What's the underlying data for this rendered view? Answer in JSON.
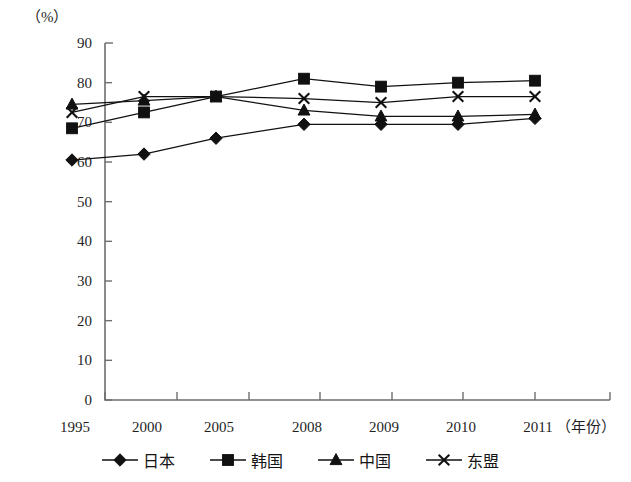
{
  "chart_data": {
    "type": "line",
    "title": "",
    "subtitle": "",
    "xlabel": "（年份）",
    "ylabel": "（%）",
    "x": [
      "1995",
      "2000",
      "2005",
      "2008",
      "2009",
      "2010",
      "2011"
    ],
    "categories": [
      "1995",
      "2000",
      "2005",
      "2008",
      "2009",
      "2010",
      "2011"
    ],
    "ylim": [
      0,
      90
    ],
    "yticks": [
      0,
      10,
      20,
      30,
      40,
      50,
      60,
      70,
      80,
      90
    ],
    "ytick_labels": [
      "0",
      "10",
      "20",
      "30",
      "40",
      "50",
      "60",
      "70",
      "80",
      "90"
    ],
    "grid": false,
    "legend_position": "bottom",
    "series": [
      {
        "name": "日本",
        "marker": "diamond",
        "color": "#111111",
        "values": [
          60.5,
          62.0,
          66.0,
          69.5,
          69.5,
          69.5,
          71.0
        ]
      },
      {
        "name": "韩国",
        "marker": "square",
        "color": "#111111",
        "values": [
          68.5,
          72.5,
          76.5,
          81.0,
          79.0,
          80.0,
          80.5
        ]
      },
      {
        "name": "中国",
        "marker": "triangle",
        "color": "#111111",
        "values": [
          74.5,
          75.5,
          76.5,
          73.0,
          71.5,
          71.5,
          72.0
        ]
      },
      {
        "name": "东盟",
        "marker": "cross",
        "color": "#111111",
        "values": [
          72.5,
          76.5,
          76.5,
          76.0,
          75.0,
          76.5,
          76.5
        ]
      }
    ]
  },
  "axes": {
    "unit_label": "（%）",
    "x_axis_caption": "（年份）"
  },
  "legend": {
    "items": [
      {
        "label": "日本",
        "marker": "diamond"
      },
      {
        "label": "韩国",
        "marker": "square"
      },
      {
        "label": "中国",
        "marker": "triangle"
      },
      {
        "label": "东盟",
        "marker": "cross"
      }
    ]
  },
  "colors": {
    "ink": "#111111",
    "axis": "#6e6e6e",
    "background": "#ffffff"
  }
}
